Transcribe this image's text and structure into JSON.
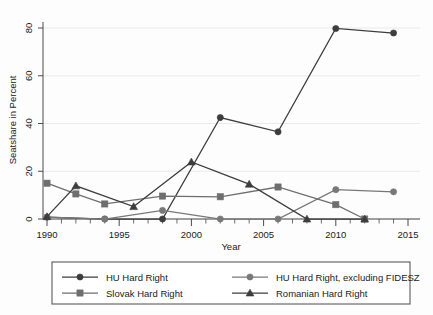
{
  "chart_data": {
    "type": "line",
    "title": "",
    "xlabel": "Year",
    "ylabel": "Seatshare in Percent",
    "xlim": [
      1989,
      2015.6
    ],
    "ylim": [
      -2,
      83
    ],
    "xticks": [
      1990,
      1995,
      2000,
      2005,
      2010,
      2015
    ],
    "xtick_labels": [
      "1990",
      "1995",
      "2000",
      "2005",
      "2010",
      "2015"
    ],
    "yticks": [
      0,
      20,
      40,
      60,
      80
    ],
    "ytick_labels": [
      "0",
      "20",
      "40",
      "60",
      "80"
    ],
    "grid": "horizontal",
    "legend_position": "below",
    "legend_columns": 2,
    "series": [
      {
        "name": "HU Hard Right",
        "marker": "circle",
        "color": "#3d3d3d",
        "x": [
          1990,
          1994,
          1998,
          2002,
          2006,
          2010,
          2014
        ],
        "y": [
          0.8,
          0.0,
          0.0,
          42.5,
          36.5,
          79.8,
          77.9
        ]
      },
      {
        "name": "HU Hard Right, excluding FIDESZ",
        "marker": "circle",
        "color": "#787878",
        "x": [
          1990,
          1994,
          1998,
          2002,
          2006,
          2010,
          2014
        ],
        "y": [
          0.8,
          0.0,
          3.6,
          0.0,
          0.0,
          12.3,
          11.4
        ]
      },
      {
        "name": "Slovak Hard Right",
        "marker": "square",
        "color": "#6e6e6e",
        "x": [
          1990,
          1992,
          1994,
          1998,
          2002,
          2006,
          2010,
          2012
        ],
        "y": [
          15.0,
          10.5,
          6.3,
          9.6,
          9.3,
          13.4,
          6.0,
          0.0
        ]
      },
      {
        "name": "Romanian Hard Right",
        "marker": "triangle",
        "color": "#3d3d3d",
        "x": [
          1990,
          1992,
          1996,
          2000,
          2004,
          2008,
          2012
        ],
        "y": [
          1.0,
          13.9,
          5.2,
          23.9,
          14.6,
          0.0,
          0.0
        ]
      }
    ],
    "legend": [
      {
        "label": "HU Hard Right",
        "marker": "circle",
        "color": "#3d3d3d"
      },
      {
        "label": "HU Hard Right, excluding FIDESZ",
        "marker": "circle",
        "color": "#787878"
      },
      {
        "label": "Slovak Hard Right",
        "marker": "square",
        "color": "#6e6e6e"
      },
      {
        "label": "Romanian Hard Right",
        "marker": "triangle",
        "color": "#3d3d3d"
      }
    ]
  }
}
